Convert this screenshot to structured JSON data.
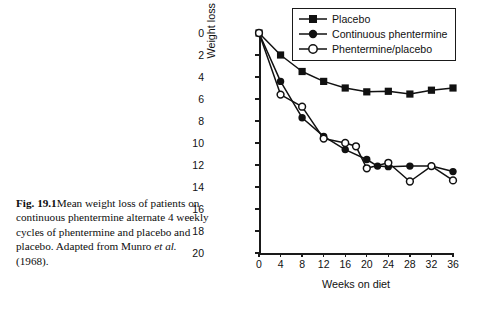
{
  "caption": {
    "figure_number": "Fig. 19.1",
    "text_part1": "Mean weight loss of patients on continuous phentermine alternate 4 weekly cycles of phentermine and placebo and placebo. Adapted from Munro ",
    "italic_part": "et al.",
    "text_part2": " (1968)."
  },
  "legend": {
    "items": [
      {
        "label": "Placebo",
        "marker": "filled-square-marker"
      },
      {
        "label": "Continuous phentermine",
        "marker": "filled-circle-marker"
      },
      {
        "label": "Phentermine/placebo",
        "marker": "open-circle-marker"
      }
    ]
  },
  "chart_data": {
    "type": "line",
    "title": "",
    "xlabel": "Weeks on diet",
    "ylabel": "Weight loss (kg)",
    "xlim": [
      0,
      36
    ],
    "ylim": [
      0,
      20
    ],
    "y_inverted": true,
    "grid": false,
    "legend_position": "top-right",
    "xticks": [
      0,
      4,
      8,
      12,
      16,
      20,
      24,
      28,
      32,
      36
    ],
    "yticks": [
      0,
      2,
      4,
      6,
      8,
      10,
      12,
      14,
      16,
      18,
      20
    ],
    "series": [
      {
        "name": "Placebo",
        "marker": "filled-square",
        "x": [
          0,
          4,
          8,
          12,
          16,
          20,
          24,
          28,
          32,
          36
        ],
        "values": [
          0,
          2.0,
          3.5,
          4.4,
          5.0,
          5.35,
          5.3,
          5.55,
          5.2,
          5.0
        ]
      },
      {
        "name": "Continuous phentermine",
        "marker": "filled-circle",
        "x": [
          0,
          4,
          8,
          12,
          16,
          20,
          22,
          24,
          28,
          32,
          36
        ],
        "values": [
          0,
          4.4,
          7.7,
          9.4,
          10.6,
          11.5,
          12.1,
          12.15,
          12.1,
          12.1,
          12.6
        ]
      },
      {
        "name": "Phentermine/placebo",
        "marker": "open-circle",
        "x": [
          0,
          4,
          8,
          12,
          16,
          18,
          20,
          24,
          28,
          32,
          36
        ],
        "values": [
          0,
          5.6,
          6.7,
          9.6,
          10.0,
          10.3,
          12.3,
          11.8,
          13.5,
          12.1,
          13.4
        ]
      }
    ]
  }
}
